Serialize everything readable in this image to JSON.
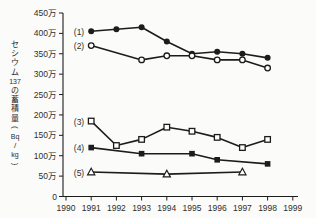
{
  "chart_data": {
    "type": "line",
    "title": "",
    "xlabel": "",
    "ylabel": "セシウム137の蓄積量(Bq/kg)",
    "ylabel_stack": [
      "セ",
      "シ",
      "ウ",
      "ム",
      "137",
      "の",
      "蓄",
      "積",
      "量",
      "(",
      "Bq",
      "/",
      "kg",
      ")"
    ],
    "y_unit": "万",
    "ylim": [
      0,
      450
    ],
    "xlim": [
      1990,
      1999
    ],
    "grid": false,
    "legend_position": "inline-left-of-first-point",
    "y_ticks": [
      {
        "value": 0,
        "label": "0"
      },
      {
        "value": 50,
        "label": "50万"
      },
      {
        "value": 100,
        "label": "100万"
      },
      {
        "value": 150,
        "label": "150万"
      },
      {
        "value": 200,
        "label": "200万"
      },
      {
        "value": 250,
        "label": "250万"
      },
      {
        "value": 300,
        "label": "300万"
      },
      {
        "value": 350,
        "label": "350万"
      },
      {
        "value": 400,
        "label": "400万"
      },
      {
        "value": 450,
        "label": "450万"
      }
    ],
    "x_ticks": [
      "1990",
      "1991",
      "1992",
      "1993",
      "1994",
      "1995",
      "1996",
      "1997",
      "1998",
      "1999"
    ],
    "series": [
      {
        "label": "(1)",
        "marker": "filled-circle",
        "x": [
          1991,
          1992,
          1993,
          1994,
          1995,
          1996,
          1997,
          1998
        ],
        "values": [
          405,
          410,
          415,
          380,
          350,
          355,
          350,
          340
        ]
      },
      {
        "label": "(2)",
        "marker": "open-circle",
        "x": [
          1991,
          1993,
          1994,
          1995,
          1996,
          1997,
          1998
        ],
        "values": [
          370,
          335,
          345,
          345,
          335,
          335,
          315
        ]
      },
      {
        "label": "(3)",
        "marker": "open-square",
        "x": [
          1991,
          1992,
          1993,
          1994,
          1995,
          1996,
          1997,
          1998
        ],
        "values": [
          185,
          125,
          140,
          170,
          160,
          145,
          120,
          140
        ]
      },
      {
        "label": "(4)",
        "marker": "filled-square",
        "x": [
          1991,
          1993,
          1995,
          1996,
          1998
        ],
        "values": [
          120,
          105,
          105,
          90,
          80
        ]
      },
      {
        "label": "(5)",
        "marker": "open-triangle",
        "x": [
          1991,
          1994,
          1997
        ],
        "values": [
          60,
          55,
          60
        ]
      }
    ]
  },
  "colors": {
    "line": "#1c1c1c",
    "marker_fill": "#1c1c1c",
    "marker_open_fill": "#ffffff",
    "text": "#2e2e2e",
    "background": "#fbfbfa"
  }
}
